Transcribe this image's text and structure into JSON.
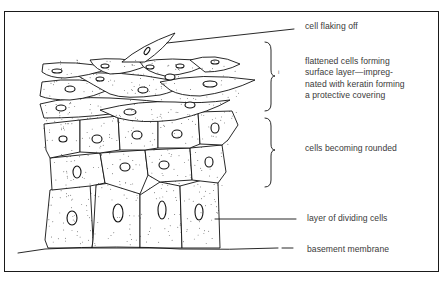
{
  "figure": {
    "labels": [
      {
        "id": "cell-flaking-off",
        "text": "cell flaking off",
        "x": 305,
        "y": 21
      },
      {
        "id": "flattened-cells",
        "text": "flattened cells forming\nsurface layer—impreg-\nnated with keratin forming\na protective covering",
        "x": 305,
        "y": 57
      },
      {
        "id": "cells-rounded",
        "text": "cells becoming rounded",
        "x": 305,
        "y": 143
      },
      {
        "id": "dividing-cells",
        "text": "layer of dividing cells",
        "x": 307,
        "y": 213
      },
      {
        "id": "basement-membrane",
        "text": "basement membrane",
        "x": 307,
        "y": 244
      }
    ],
    "brace_mark": "i",
    "colors": {
      "ink": "#111111",
      "text": "#3a3a3a",
      "background": "#ffffff"
    }
  }
}
